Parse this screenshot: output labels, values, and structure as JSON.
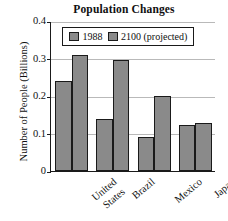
{
  "chart_data": {
    "type": "bar",
    "title": "Population Changes",
    "xlabel": "",
    "ylabel": "Number of People (Billions)",
    "categories": [
      "United States",
      "Brazil",
      "Mexico",
      "Japan"
    ],
    "category_lines": [
      [
        "United",
        "States"
      ],
      [
        "Brazil"
      ],
      [
        "Mexico"
      ],
      [
        "Japan"
      ]
    ],
    "series": [
      {
        "name": "1988",
        "values": [
          0.24,
          0.14,
          0.09,
          0.122
        ],
        "color": "#8a8a8a"
      },
      {
        "name": "2100 (projected)",
        "values": [
          0.31,
          0.295,
          0.2,
          0.129
        ],
        "color": "#8a8a8a"
      }
    ],
    "ylim": [
      0,
      0.4
    ],
    "yticks": [
      0,
      0.1,
      0.2,
      0.3,
      0.4
    ],
    "ytick_labels": [
      "0",
      "0.1",
      "0.2",
      "0.3",
      "0.4"
    ],
    "grid": true,
    "grid_axis": "y",
    "legend_position": "upper-center-inside",
    "bar_edge_color": "#1a1a1a",
    "axis_color": "#1a1a1a",
    "gridline_color": "#b9b9b9",
    "background": "#ffffff"
  }
}
